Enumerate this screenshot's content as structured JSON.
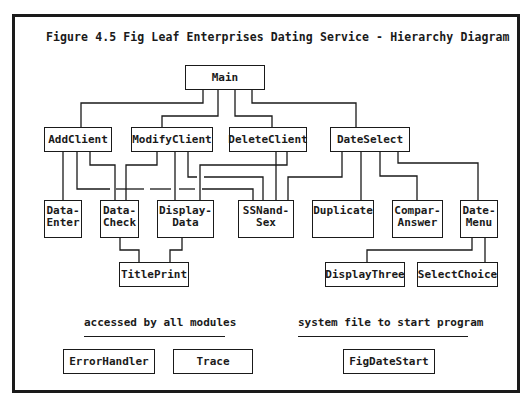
{
  "title": "Figure 4.5  Fig Leaf Enterprises Dating Service - Hierarchy Diagram",
  "nodes": {
    "main": "Main",
    "add_client": "AddClient",
    "modify_client": "ModifyClient",
    "delete_client": "DeleteClient",
    "date_select": "DateSelect",
    "data_enter": "Data-\nEnter",
    "data_check": "Data-\nCheck",
    "display_data": "Display-\nData",
    "ssn_and_sex": "SSNand-\nSex",
    "duplicate": "Duplicate",
    "compar_answer": "Compar-\nAnswer",
    "date_menu": "Date-\nMenu",
    "title_print": "TitlePrint",
    "display_three": "DisplayThree",
    "select_choice": "SelectChoice",
    "error_handler": "ErrorHandler",
    "trace": "Trace",
    "fig_date_start": "FigDateStart"
  },
  "legend": {
    "shared_label": "accessed by all modules",
    "startup_label": "system file to start program"
  },
  "edges": [
    [
      "Main",
      "AddClient"
    ],
    [
      "Main",
      "ModifyClient"
    ],
    [
      "Main",
      "DeleteClient"
    ],
    [
      "Main",
      "DateSelect"
    ],
    [
      "AddClient",
      "Data-Enter"
    ],
    [
      "AddClient",
      "Data-Check"
    ],
    [
      "AddClient",
      "SSNand-Sex"
    ],
    [
      "ModifyClient",
      "Data-Check"
    ],
    [
      "ModifyClient",
      "Display-Data"
    ],
    [
      "ModifyClient",
      "SSNand-Sex"
    ],
    [
      "DeleteClient",
      "Display-Data"
    ],
    [
      "DeleteClient",
      "SSNand-Sex"
    ],
    [
      "DateSelect",
      "SSNand-Sex"
    ],
    [
      "DateSelect",
      "Duplicate"
    ],
    [
      "DateSelect",
      "Compar-Answer"
    ],
    [
      "DateSelect",
      "Date-Menu"
    ],
    [
      "Data-Check",
      "TitlePrint"
    ],
    [
      "Display-Data",
      "TitlePrint"
    ],
    [
      "Date-Menu",
      "DisplayThree"
    ],
    [
      "Date-Menu",
      "SelectChoice"
    ]
  ]
}
